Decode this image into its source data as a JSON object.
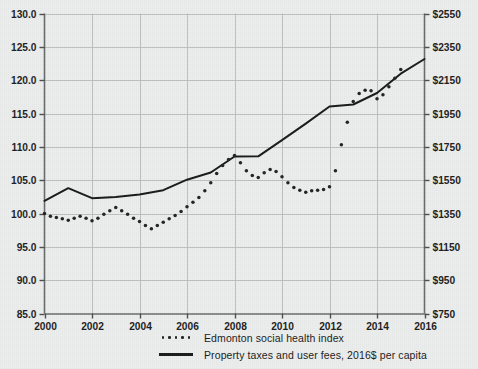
{
  "chart_data": {
    "type": "line",
    "title": "",
    "subtitle": "",
    "xlabel": "",
    "ylabel": "",
    "grid": true,
    "legend_position": "bottom",
    "x": [
      2000,
      2001,
      2002,
      2003,
      2004,
      2005,
      2006,
      2007,
      2008,
      2009,
      2010,
      2011,
      2012,
      2013,
      2014,
      2015,
      2016
    ],
    "xlim": [
      2000,
      2016
    ],
    "xticks": [
      "2000",
      "2002",
      "2004",
      "2006",
      "2008",
      "2010",
      "2012",
      "2014",
      "2016"
    ],
    "xtick_values": [
      2000,
      2002,
      2004,
      2006,
      2008,
      2010,
      2012,
      2014,
      2016
    ],
    "left_axis": {
      "label": "",
      "ylim": [
        85.0,
        130.0
      ],
      "ticks": [
        "85.0",
        "90.0",
        "95.0",
        "100.0",
        "105.0",
        "110.0",
        "115.0",
        "120.0",
        "125.0",
        "130.0"
      ],
      "tick_values": [
        85.0,
        90.0,
        95.0,
        100.0,
        105.0,
        110.0,
        115.0,
        120.0,
        125.0,
        130.0
      ]
    },
    "right_axis": {
      "label": "",
      "ylim": [
        750,
        2550
      ],
      "ticks": [
        "$750",
        "$950",
        "$1150",
        "$1350",
        "$1550",
        "$1750",
        "$1950",
        "$2150",
        "$2350",
        "$2550"
      ],
      "tick_values": [
        750,
        950,
        1150,
        1350,
        1550,
        1750,
        1950,
        2150,
        2350,
        2550
      ]
    },
    "series": [
      {
        "name": "Edmonton social health index",
        "style": "dotted",
        "axis": "left",
        "color": "#222222",
        "x": [
          2000.0,
          2000.25,
          2000.5,
          2000.75,
          2001.0,
          2001.25,
          2001.5,
          2001.75,
          2002.0,
          2002.25,
          2002.5,
          2002.75,
          2003.0,
          2003.25,
          2003.5,
          2003.75,
          2004.0,
          2004.25,
          2004.5,
          2004.75,
          2005.0,
          2005.25,
          2005.5,
          2005.75,
          2006.0,
          2006.25,
          2006.5,
          2006.75,
          2007.0,
          2007.25,
          2007.5,
          2007.75,
          2008.0,
          2008.25,
          2008.5,
          2008.75,
          2009.0,
          2009.25,
          2009.5,
          2009.75,
          2010.0,
          2010.25,
          2010.5,
          2010.75,
          2011.0,
          2011.25,
          2011.5,
          2011.75,
          2012.0,
          2012.25,
          2012.5,
          2012.75,
          2013.0,
          2013.25,
          2013.5,
          2013.75,
          2014.0,
          2014.25,
          2014.5,
          2014.75,
          2015.0
        ],
        "values": [
          100.0,
          99.6,
          99.4,
          99.2,
          99.0,
          99.3,
          99.6,
          99.3,
          98.9,
          99.3,
          99.9,
          100.4,
          100.9,
          100.4,
          99.9,
          99.3,
          98.8,
          98.2,
          97.7,
          98.2,
          98.7,
          99.2,
          99.7,
          100.3,
          101.0,
          101.7,
          102.4,
          103.4,
          104.6,
          106.0,
          107.2,
          108.1,
          108.7,
          107.6,
          106.4,
          105.7,
          105.4,
          106.1,
          106.6,
          106.3,
          105.5,
          104.6,
          103.9,
          103.5,
          103.2,
          103.4,
          103.5,
          103.6,
          104.0,
          106.4,
          110.3,
          113.7,
          116.8,
          118.0,
          118.5,
          118.4,
          117.2,
          117.8,
          119.0,
          120.3,
          121.6
        ],
        "data_x_label_range": "2000-2015",
        "notes": "Quarterly-resolution dotted series on the left axis; starts at index 100 in 2000, dips to ~97.7 in 2004, rises to ~108.7 in 2008, falls back to ~103.2 in 2011, then rises sharply to ~118.5 in 2012-2013 and ~124 by 2015."
      },
      {
        "name": "Property taxes and user fees, 2016$ per capita",
        "style": "solid",
        "axis": "right",
        "color": "#1a1a1a",
        "x": [
          2000,
          2001,
          2002,
          2003,
          2004,
          2005,
          2006,
          2007,
          2008,
          2009,
          2010,
          2011,
          2012,
          2013,
          2014,
          2015,
          2016
        ],
        "values": [
          1426,
          1502,
          1442,
          1449,
          1464,
          1490,
          1553,
          1596,
          1692,
          1693,
          1790,
          1889,
          1992,
          2004,
          2073,
          2189,
          2277
        ],
        "left_scale_equivalent": [
          103.2,
          105.1,
          103.6,
          103.8,
          104.2,
          104.8,
          106.4,
          107.5,
          109.9,
          109.9,
          112.3,
          114.8,
          117.3,
          117.6,
          119.3,
          122.2,
          124.4
        ],
        "notes": "Solid line plotted against the right dollar axis; rises from about $1430 per capita in 2000 to about $2280 per capita in 2016, with a local peak in 2001 and a plateau in 2008-2009."
      }
    ],
    "legend": [
      {
        "label": "Edmonton social health index",
        "marker": "dotted"
      },
      {
        "label": "Property taxes and user fees, 2016$ per capita",
        "marker": "solid-line"
      }
    ]
  }
}
